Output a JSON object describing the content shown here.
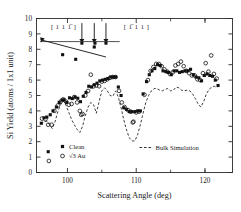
{
  "chart_data": {
    "type": "scatter",
    "title": "",
    "xlabel": "Scattering Angle (deg)",
    "ylabel": "Si Yield (atoms / 1x1 unit)",
    "xlim": [
      95.5,
      124.0
    ],
    "ylim": [
      0,
      10
    ],
    "xticks": [
      100,
      110,
      120
    ],
    "xticklabels": [
      "100",
      "110",
      "120"
    ],
    "xminorticks": [
      95,
      105,
      115,
      120
    ],
    "yticks": [
      0,
      1,
      2,
      3,
      4,
      5,
      6,
      7,
      8,
      9,
      10
    ],
    "yticklabels": [
      "0",
      "1",
      "2",
      "3",
      "4",
      "5",
      "6",
      "7",
      "8",
      "9",
      "10"
    ],
    "grid": false,
    "legend_position": "lower-center",
    "legend": [
      {
        "label": "Clean",
        "marker": "filled-square",
        "color": "#111111"
      },
      {
        "label": "√3 Au",
        "marker": "open-circle",
        "color": "#111111"
      },
      {
        "label": "Bulk Simulation",
        "marker": "dashed-line",
        "color": "#111111"
      }
    ],
    "annotations": [
      {
        "text": "[ 1 1 1̅ ]",
        "x": 97.6,
        "y": 9.35
      },
      {
        "text": "[ 1̅ 1 1 ]",
        "x": 108.2,
        "y": 9.35
      },
      {
        "type": "arrow-down",
        "x": 102.1,
        "y_from": 9.7,
        "y_to": 8.45
      },
      {
        "type": "arrow-down",
        "x": 103.9,
        "y_from": 9.7,
        "y_to": 8.45
      },
      {
        "type": "arrow-down",
        "x": 105.6,
        "y_from": 9.7,
        "y_to": 8.45
      },
      {
        "type": "reference-line",
        "x_from": 96.0,
        "x_to": 107.6,
        "y": 8.5
      },
      {
        "type": "trend-line",
        "x_from": 96.1,
        "y_from": 8.62,
        "x_to": 105.6,
        "y_to": 7.5
      }
    ],
    "series": [
      {
        "name": "Clean",
        "marker": "filled-square",
        "points": [
          [
            96.2,
            3.2
          ],
          [
            96.6,
            3.55
          ],
          [
            97.0,
            3.6
          ],
          [
            97.5,
            3.75
          ],
          [
            97.9,
            4.0
          ],
          [
            98.4,
            4.25
          ],
          [
            98.8,
            4.55
          ],
          [
            99.2,
            4.7
          ],
          [
            99.5,
            4.72
          ],
          [
            99.9,
            4.55
          ],
          [
            100.3,
            4.85
          ],
          [
            100.7,
            4.8
          ],
          [
            101.1,
            4.9
          ],
          [
            101.5,
            4.82
          ],
          [
            101.9,
            4.6
          ],
          [
            102.3,
            4.95
          ],
          [
            102.7,
            5.2
          ],
          [
            103.1,
            5.6
          ],
          [
            103.5,
            5.55
          ],
          [
            103.9,
            5.7
          ],
          [
            104.3,
            5.8
          ],
          [
            104.7,
            5.95
          ],
          [
            105.1,
            6.0
          ],
          [
            105.5,
            6.05
          ],
          [
            105.9,
            6.1
          ],
          [
            106.3,
            6.2
          ],
          [
            106.7,
            6.2
          ],
          [
            107.0,
            6.2
          ],
          [
            107.4,
            5.55
          ],
          [
            107.8,
            5.0
          ],
          [
            108.2,
            4.2
          ],
          [
            108.6,
            4.1
          ],
          [
            109.0,
            3.95
          ],
          [
            109.4,
            3.95
          ],
          [
            109.8,
            3.95
          ],
          [
            110.2,
            4.0
          ],
          [
            110.6,
            4.0
          ],
          [
            111.0,
            5.1
          ],
          [
            111.5,
            5.9
          ],
          [
            111.9,
            6.35
          ],
          [
            112.3,
            6.6
          ],
          [
            112.7,
            6.75
          ],
          [
            113.1,
            7.0
          ],
          [
            113.5,
            6.95
          ],
          [
            113.9,
            6.6
          ],
          [
            114.3,
            6.55
          ],
          [
            114.7,
            6.5
          ],
          [
            115.1,
            6.35
          ],
          [
            115.5,
            6.6
          ],
          [
            115.9,
            6.6
          ],
          [
            116.3,
            6.5
          ],
          [
            116.7,
            6.55
          ],
          [
            117.1,
            6.6
          ],
          [
            117.5,
            6.6
          ],
          [
            117.9,
            6.7
          ],
          [
            118.3,
            6.35
          ],
          [
            118.7,
            6.2
          ],
          [
            119.1,
            6.15
          ],
          [
            119.5,
            5.95
          ],
          [
            119.9,
            6.3
          ],
          [
            120.3,
            6.4
          ],
          [
            120.7,
            6.3
          ],
          [
            121.1,
            6.25
          ],
          [
            121.5,
            6.0
          ],
          [
            121.9,
            5.65
          ],
          [
            99.3,
            7.65
          ],
          [
            101.2,
            7.35
          ],
          [
            104.0,
            8.4
          ],
          [
            105.6,
            8.4
          ],
          [
            102.1,
            8.4
          ],
          [
            103.9,
            8.15
          ],
          [
            97.2,
            1.35
          ]
        ]
      },
      {
        "name": "√3 Au",
        "marker": "open-circle",
        "points": [
          [
            96.3,
            3.5
          ],
          [
            96.8,
            3.45
          ],
          [
            97.2,
            3.1
          ],
          [
            97.7,
            3.1
          ],
          [
            98.1,
            4.0
          ],
          [
            98.6,
            4.35
          ],
          [
            99.0,
            4.6
          ],
          [
            99.4,
            4.75
          ],
          [
            99.8,
            4.6
          ],
          [
            100.2,
            4.4
          ],
          [
            100.6,
            4.45
          ],
          [
            101.0,
            4.9
          ],
          [
            101.4,
            4.55
          ],
          [
            101.8,
            4.0
          ],
          [
            102.2,
            3.8
          ],
          [
            102.6,
            5.0
          ],
          [
            103.0,
            5.3
          ],
          [
            103.4,
            6.35
          ],
          [
            103.8,
            5.6
          ],
          [
            104.2,
            5.65
          ],
          [
            104.6,
            5.6
          ],
          [
            105.0,
            5.9
          ],
          [
            105.4,
            5.95
          ],
          [
            105.8,
            6.05
          ],
          [
            106.2,
            6.15
          ],
          [
            106.6,
            6.2
          ],
          [
            107.0,
            6.2
          ],
          [
            107.5,
            5.3
          ],
          [
            107.9,
            4.55
          ],
          [
            108.3,
            4.25
          ],
          [
            108.8,
            4.05
          ],
          [
            109.2,
            3.95
          ],
          [
            109.6,
            3.3
          ],
          [
            110.0,
            3.9
          ],
          [
            110.4,
            3.95
          ],
          [
            111.2,
            5.05
          ],
          [
            111.7,
            6.0
          ],
          [
            112.1,
            6.6
          ],
          [
            112.5,
            6.85
          ],
          [
            112.9,
            7.05
          ],
          [
            113.3,
            7.05
          ],
          [
            113.7,
            6.9
          ],
          [
            114.1,
            6.7
          ],
          [
            114.5,
            6.55
          ],
          [
            114.9,
            6.4
          ],
          [
            115.3,
            6.5
          ],
          [
            115.7,
            6.95
          ],
          [
            116.1,
            7.05
          ],
          [
            116.5,
            7.2
          ],
          [
            116.9,
            6.9
          ],
          [
            117.3,
            6.6
          ],
          [
            117.7,
            6.45
          ],
          [
            118.1,
            6.3
          ],
          [
            118.5,
            6.3
          ],
          [
            118.9,
            6.05
          ],
          [
            119.3,
            6.0
          ],
          [
            119.7,
            6.45
          ],
          [
            120.1,
            7.1
          ],
          [
            120.5,
            6.55
          ],
          [
            120.9,
            7.6
          ],
          [
            121.3,
            6.4
          ],
          [
            121.7,
            6.1
          ],
          [
            102.0,
            3.75
          ],
          [
            109.5,
            3.25
          ],
          [
            97.3,
            0.75
          ]
        ]
      },
      {
        "name": "Bulk Simulation",
        "marker": "dashed-line",
        "points": [
          [
            96.2,
            3.15
          ],
          [
            96.6,
            3.3
          ],
          [
            97.0,
            3.35
          ],
          [
            97.4,
            3.1
          ],
          [
            97.8,
            2.85
          ],
          [
            98.2,
            3.3
          ],
          [
            98.6,
            3.95
          ],
          [
            99.0,
            4.4
          ],
          [
            99.4,
            4.65
          ],
          [
            99.8,
            4.35
          ],
          [
            100.2,
            3.9
          ],
          [
            100.6,
            3.45
          ],
          [
            101.0,
            3.1
          ],
          [
            101.4,
            2.8
          ],
          [
            101.8,
            2.6
          ],
          [
            102.2,
            3.0
          ],
          [
            102.6,
            3.7
          ],
          [
            103.0,
            4.25
          ],
          [
            103.4,
            4.55
          ],
          [
            103.8,
            4.4
          ],
          [
            104.2,
            3.85
          ],
          [
            104.6,
            4.6
          ],
          [
            105.0,
            5.3
          ],
          [
            105.4,
            5.5
          ],
          [
            105.8,
            5.3
          ],
          [
            106.2,
            5.0
          ],
          [
            106.6,
            4.95
          ],
          [
            107.0,
            5.3
          ],
          [
            107.4,
            4.9
          ],
          [
            107.8,
            4.2
          ],
          [
            108.2,
            3.4
          ],
          [
            108.6,
            2.75
          ],
          [
            109.0,
            2.25
          ],
          [
            109.4,
            2.05
          ],
          [
            109.8,
            2.05
          ],
          [
            110.2,
            2.45
          ],
          [
            110.6,
            3.1
          ],
          [
            111.0,
            3.85
          ],
          [
            111.4,
            4.55
          ],
          [
            111.8,
            5.0
          ],
          [
            112.2,
            5.3
          ],
          [
            112.6,
            5.45
          ],
          [
            113.0,
            5.45
          ],
          [
            113.4,
            5.35
          ],
          [
            113.8,
            5.3
          ],
          [
            114.2,
            5.4
          ],
          [
            114.6,
            5.45
          ],
          [
            115.0,
            5.3
          ],
          [
            115.4,
            5.35
          ],
          [
            115.8,
            5.55
          ],
          [
            116.2,
            5.5
          ],
          [
            116.6,
            5.35
          ],
          [
            117.0,
            5.3
          ],
          [
            117.4,
            5.35
          ],
          [
            117.8,
            5.3
          ],
          [
            118.2,
            5.1
          ],
          [
            118.6,
            4.8
          ],
          [
            119.0,
            4.45
          ],
          [
            119.4,
            4.25
          ],
          [
            119.8,
            4.6
          ],
          [
            120.2,
            5.1
          ],
          [
            120.6,
            5.4
          ],
          [
            121.0,
            5.55
          ],
          [
            121.4,
            5.6
          ],
          [
            121.8,
            5.5
          ]
        ]
      }
    ]
  }
}
